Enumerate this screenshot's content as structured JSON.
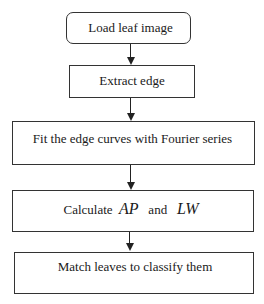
{
  "flowchart": {
    "steps": [
      {
        "id": "load",
        "label": "Load leaf image"
      },
      {
        "id": "extract",
        "label": "Extract edge"
      },
      {
        "id": "fit",
        "label": "Fit the edge curves with Fourier series"
      },
      {
        "id": "calculate",
        "label_prefix": "Calculate",
        "var1": "AP",
        "conj": "and",
        "var2": "LW"
      },
      {
        "id": "match",
        "label": "Match leaves to classify them"
      }
    ]
  }
}
